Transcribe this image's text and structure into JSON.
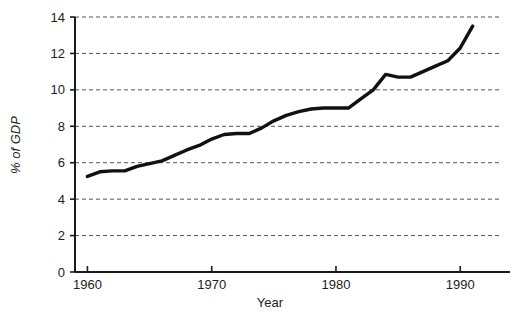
{
  "chart_data": {
    "type": "line",
    "title": "",
    "xlabel": "Year",
    "ylabel": "% of GDP",
    "xlim": [
      1959,
      1993.2
    ],
    "ylim": [
      0,
      14
    ],
    "grid": true,
    "legend": null,
    "x_ticks": [
      1960,
      1970,
      1980,
      1990
    ],
    "x_tick_labels": [
      "1960",
      "1970",
      "1980",
      "1990"
    ],
    "y_ticks": [
      0,
      2,
      4,
      6,
      8,
      10,
      12,
      14
    ],
    "y_tick_labels": [
      "0",
      "2",
      "4",
      "6",
      "8",
      "10",
      "12",
      "14"
    ],
    "line_color": "#111111",
    "line_width": 3.4,
    "grid_color": "#555555",
    "axis_color": "#1a1a1a",
    "series": [
      {
        "name": "% of GDP",
        "x": [
          1960,
          1961,
          1962,
          1963,
          1964,
          1965,
          1966,
          1967,
          1968,
          1969,
          1970,
          1971,
          1972,
          1973,
          1974,
          1975,
          1976,
          1977,
          1978,
          1979,
          1980,
          1981,
          1982,
          1983,
          1984,
          1985,
          1986,
          1987,
          1988,
          1989,
          1990,
          1991
        ],
        "values": [
          5.25,
          5.5,
          5.55,
          5.55,
          5.8,
          5.95,
          6.1,
          6.4,
          6.7,
          6.95,
          7.3,
          7.55,
          7.6,
          7.6,
          7.9,
          8.3,
          8.6,
          8.8,
          8.95,
          9.0,
          9.0,
          9.0,
          9.5,
          10.0,
          10.85,
          10.7,
          10.7,
          11.0,
          11.3,
          11.6,
          12.3,
          13.5
        ]
      }
    ]
  },
  "axes": {
    "x_axis_name": "Year",
    "y_axis_name": "% of GDP"
  }
}
